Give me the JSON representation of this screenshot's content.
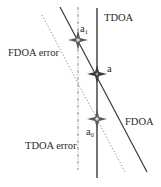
{
  "diagram": {
    "type": "geolocation-line-intersection",
    "lines": {
      "tdoa": {
        "label": "TDOA",
        "style": "solid",
        "orientation": "vertical"
      },
      "tdoa_error": {
        "label": "TDOA error",
        "style": "dash-dot",
        "orientation": "vertical"
      },
      "fdoa": {
        "label": "FDOA",
        "style": "solid",
        "orientation": "diagonal"
      },
      "fdoa_error": {
        "label": "FDOA error",
        "style": "dotted",
        "orientation": "diagonal"
      }
    },
    "points": {
      "a": {
        "base": "a",
        "sub": "",
        "description": "TDOA ∩ FDOA"
      },
      "a1": {
        "base": "a",
        "sub": "1",
        "description": "TDOA error ∩ FDOA"
      },
      "a0": {
        "base": "a",
        "sub": "0",
        "description": "TDOA ∩ FDOA error"
      }
    },
    "colors": {
      "line": "#3a3a3a",
      "error_line": "#8a8a8a",
      "star": "#4a4a4a",
      "star_center": "#d8d8d8",
      "background": "#ffffff"
    }
  }
}
